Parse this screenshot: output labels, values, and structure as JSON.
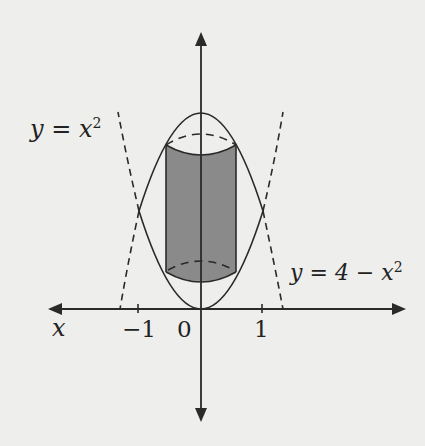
{
  "diagram": {
    "curve_labels": {
      "lower_parabola": {
        "lhs": "y",
        "eq": "=",
        "rhs": "x",
        "exp": "2"
      },
      "upper_parabola": {
        "lhs": "y",
        "eq": "=",
        "rhs": "4 − x",
        "exp": "2"
      }
    },
    "axis_labels": {
      "x": "x"
    },
    "ticks": {
      "neg_one": "−1",
      "zero": "0",
      "one": "1"
    },
    "colors": {
      "background": "#eeeeec",
      "line": "#2a2a2a",
      "cylinder_fill": "#8a8a8a"
    }
  }
}
